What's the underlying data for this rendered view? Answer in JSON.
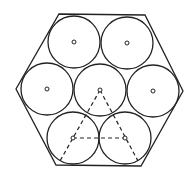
{
  "diagram": {
    "stroke_color": "#222222",
    "background": "#ffffff",
    "hexagon": {
      "points": [
        [
          59,
          14
        ],
        [
          145,
          15
        ],
        [
          183,
          91
        ],
        [
          141,
          166
        ],
        [
          56,
          165
        ],
        [
          16,
          89
        ]
      ]
    },
    "circle_radius": 26,
    "circles": [
      {
        "name": "top-left",
        "cx": 74,
        "cy": 42
      },
      {
        "name": "top-right",
        "cx": 127,
        "cy": 43
      },
      {
        "name": "middle-left",
        "cx": 47,
        "cy": 89
      },
      {
        "name": "center",
        "cx": 100,
        "cy": 90
      },
      {
        "name": "middle-right",
        "cx": 153,
        "cy": 91
      },
      {
        "name": "bottom-left",
        "cx": 73,
        "cy": 138
      },
      {
        "name": "bottom-right",
        "cx": 125,
        "cy": 138
      }
    ],
    "center_marker_radius": 2,
    "dashed_lines": [
      {
        "name": "center-to-bottom-left",
        "x1": 100,
        "y1": 90,
        "x2": 60,
        "y2": 161
      },
      {
        "name": "center-to-bottom-right",
        "x1": 100,
        "y1": 90,
        "x2": 138,
        "y2": 161
      },
      {
        "name": "bottom-centers",
        "x1": 73,
        "y1": 138,
        "x2": 125,
        "y2": 138
      }
    ]
  }
}
